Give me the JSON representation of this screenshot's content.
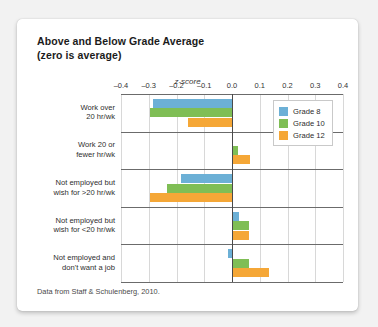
{
  "card": {
    "title_line1": "Above and Below Grade Average",
    "title_line2": "(zero is average)",
    "source_note": "Data from Staff & Schulenberg, 2010."
  },
  "colors": {
    "grade8": "#6cb0d6",
    "grade10": "#7fbe55",
    "grade12": "#f5a737",
    "zero_axis": "#4a4a4a",
    "gridline": "#d8d8d8",
    "card_background": "#ffffff",
    "page_background": "#f2f2f2"
  },
  "legend": {
    "position": "top-right-inside-plot",
    "entries": [
      {
        "label": "Grade 8",
        "color": "#6cb0d6"
      },
      {
        "label": "Grade 10",
        "color": "#7fbe55"
      },
      {
        "label": "Grade 12",
        "color": "#f5a737"
      }
    ]
  },
  "chart_data": {
    "type": "bar",
    "orientation": "horizontal",
    "title": "Above and Below Grade Average (zero is average)",
    "xlabel": "z-score",
    "ylabel": "",
    "xlim": [
      -0.4,
      0.4
    ],
    "xticks": [
      "-0.4",
      "-0.3",
      "-0.2",
      "-0.1",
      "0.0",
      "0.1",
      "0.2",
      "0.3",
      "0.4"
    ],
    "xtick_values": [
      -0.4,
      -0.3,
      -0.2,
      -0.1,
      0.0,
      0.1,
      0.2,
      0.3,
      0.4
    ],
    "grid": true,
    "zero_line": 0.0,
    "legend_position": "upper right",
    "categories": [
      "Work over 20 hr/wk",
      "Work 20 or fewer hr/wk",
      "Not employed but wish for >20 hr/wk",
      "Not employed but wish for <20 hr/wk",
      "Not employed and don't want a job"
    ],
    "category_lines": [
      [
        "Work over",
        "20 hr/wk"
      ],
      [
        "Work 20 or",
        "fewer hr/wk"
      ],
      [
        "Not employed but",
        "wish for >20 hr/wk"
      ],
      [
        "Not employed but",
        "wish for <20 hr/wk"
      ],
      [
        "Not employed and",
        "don't want a job"
      ]
    ],
    "series": [
      {
        "name": "Grade 8",
        "color": "#6cb0d6",
        "values": [
          -0.285,
          0.005,
          -0.185,
          0.025,
          -0.015
        ]
      },
      {
        "name": "Grade 10",
        "color": "#7fbe55",
        "values": [
          -0.295,
          0.02,
          -0.235,
          0.06,
          0.06
        ]
      },
      {
        "name": "Grade 12",
        "color": "#f5a737",
        "values": [
          -0.16,
          0.065,
          -0.295,
          0.06,
          0.135
        ]
      }
    ]
  }
}
